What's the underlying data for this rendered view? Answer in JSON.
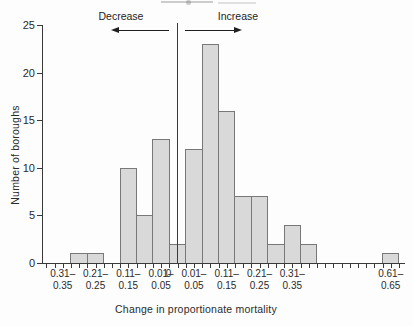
{
  "chart_data": {
    "type": "bar",
    "subtype": "histogram",
    "xlabel": "Change in proportionate mortality",
    "ylabel": "Number of boroughs",
    "ylim": [
      0,
      25
    ],
    "yticks": [
      0,
      5,
      10,
      15,
      20,
      25
    ],
    "bin_width_value": 0.05,
    "direction_annotations": {
      "left": "Decrease",
      "right": "Increase"
    },
    "bins": [
      {
        "range": "0.26–0.30",
        "side": "decrease",
        "offset": -6,
        "count": 1
      },
      {
        "range": "0.21–0.25",
        "side": "decrease",
        "offset": -5,
        "count": 1
      },
      {
        "range": "0.11–0.15",
        "side": "decrease",
        "offset": -3,
        "count": 10
      },
      {
        "range": "0.06–0.10",
        "side": "decrease",
        "offset": -2,
        "count": 5
      },
      {
        "range": "0.01–0.05",
        "side": "decrease",
        "offset": -1,
        "count": 13
      },
      {
        "range": "0",
        "side": "zero",
        "offset": 0,
        "count": 2
      },
      {
        "range": "0.01–0.05",
        "side": "increase",
        "offset": 1,
        "count": 12
      },
      {
        "range": "0.06–0.10",
        "side": "increase",
        "offset": 2,
        "count": 23
      },
      {
        "range": "0.11–0.15",
        "side": "increase",
        "offset": 3,
        "count": 16
      },
      {
        "range": "0.16–0.20",
        "side": "increase",
        "offset": 4,
        "count": 7
      },
      {
        "range": "0.21–0.25",
        "side": "increase",
        "offset": 5,
        "count": 7
      },
      {
        "range": "0.26–0.30",
        "side": "increase",
        "offset": 6,
        "count": 2
      },
      {
        "range": "0.31–0.35",
        "side": "increase",
        "offset": 7,
        "count": 4
      },
      {
        "range": "0.36–0.40",
        "side": "increase",
        "offset": 8,
        "count": 2
      },
      {
        "range": "0.61–0.65",
        "side": "increase",
        "offset": 13,
        "count": 1
      }
    ],
    "x_tick_labels": [
      {
        "line1": "0.31–",
        "line2": "0.35",
        "offset": -7
      },
      {
        "line1": "0.21–",
        "line2": "0.25",
        "offset": -5
      },
      {
        "line1": "0.11–",
        "line2": "0.15",
        "offset": -3
      },
      {
        "line1": "0.01–",
        "line2": "0.05",
        "offset": -1
      },
      {
        "line1": "0",
        "line2": "",
        "offset": -0.55
      },
      {
        "line1": "0.01–",
        "line2": "0.05",
        "offset": 1
      },
      {
        "line1": "0.11–",
        "line2": "0.15",
        "offset": 3
      },
      {
        "line1": "0.21–",
        "line2": "0.25",
        "offset": 5
      },
      {
        "line1": "0.31–",
        "line2": "0.35",
        "offset": 7
      },
      {
        "line1": "0.61–",
        "line2": "0.65",
        "offset": 13
      }
    ],
    "legend": "none",
    "grid": "off",
    "colors": {
      "bar_fill": "#d9d9d9",
      "bar_border": "#787878",
      "axis": "#3a3a3a",
      "text": "#262626",
      "background": "#fdfdfd"
    }
  }
}
